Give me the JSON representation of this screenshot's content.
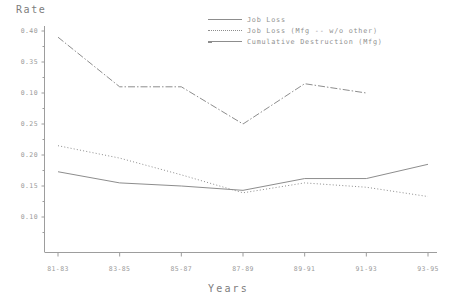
{
  "chart_data": {
    "type": "line",
    "title": "",
    "ylabel": "Rate",
    "xlabel": "Years",
    "categories": [
      "81-83",
      "83-85",
      "85-87",
      "87-89",
      "89-91",
      "91-93",
      "93-95"
    ],
    "ytick_labels": [
      "0.40",
      "0.35",
      "0.10",
      "0.25",
      "0.20",
      "0.15",
      "0.10"
    ],
    "ytick_values": [
      0.4,
      0.35,
      0.3,
      0.25,
      0.2,
      0.15,
      0.1
    ],
    "ylim": [
      0.085,
      0.405
    ],
    "grid": false,
    "legend_position": "top-right",
    "series": [
      {
        "name": "Job Loss",
        "style": "solid",
        "values": [
          0.173,
          0.155,
          0.15,
          0.143,
          0.162,
          0.162,
          0.185
        ]
      },
      {
        "name": "Job Loss (Mfg -- w/o other)",
        "style": "dotted",
        "values": [
          0.215,
          0.195,
          0.168,
          0.139,
          0.155,
          0.148,
          0.133
        ]
      },
      {
        "name": "Cumulative Destruction (Mfg)",
        "style": "dash-dot",
        "values": [
          0.39,
          0.31,
          0.31,
          0.25,
          0.315,
          0.3,
          null
        ]
      }
    ]
  },
  "axis": {
    "y_title": "Rate",
    "x_title": "Years"
  },
  "legend": {
    "entries": [
      {
        "label": "Job Loss",
        "swatch": "line-solid-icon"
      },
      {
        "label": "Job Loss (Mfg -- w/o other)",
        "swatch": "line-dotted-icon"
      },
      {
        "label": "Cumulative Destruction (Mfg)",
        "swatch": "line-dashdot-icon"
      }
    ]
  },
  "colors": {
    "line": "#8d8d8d",
    "axis": "#9d9d9d",
    "text": "#8a8a8a",
    "background": "#ffffff"
  }
}
